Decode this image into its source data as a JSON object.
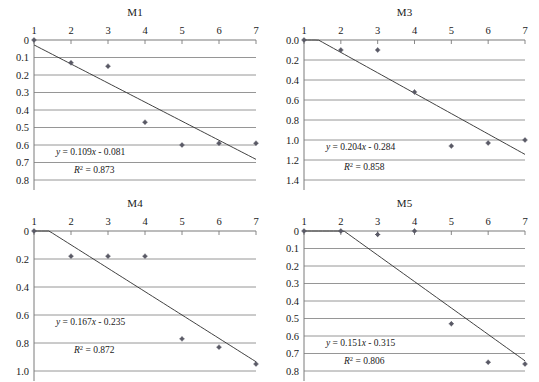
{
  "figure": {
    "background": "#ffffff",
    "marker_color": "#5a5a66",
    "grid_color": "#8a8a8a",
    "line_color": "#2b2b2b",
    "panel_count": 4
  },
  "chart_data": [
    {
      "type": "scatter",
      "title": "M1",
      "xlabel": "",
      "ylabel": "",
      "x": [
        1,
        2,
        3,
        4,
        5,
        6,
        7
      ],
      "values": [
        0.0,
        0.13,
        0.15,
        0.47,
        0.6,
        0.59,
        0.59
      ],
      "xticks": [
        "1",
        "2",
        "3",
        "4",
        "5",
        "6",
        "7"
      ],
      "yticks": [
        "0",
        "0.1",
        "0.2",
        "0.3",
        "0.4",
        "0.5",
        "0.6",
        "0.7",
        "0.8"
      ],
      "ytickvalues": [
        0,
        0.1,
        0.2,
        0.3,
        0.4,
        0.5,
        0.6,
        0.7,
        0.8
      ],
      "xlim": [
        1,
        7
      ],
      "ylim": [
        0,
        0.8
      ],
      "y_axis_inverted": true,
      "x_axis_position": "top",
      "grid": true,
      "legend": "none",
      "annotations": {
        "equation": "y = 0.109x - 0.081",
        "equation_slope": 0.109,
        "equation_intercept": -0.081,
        "r_squared_label": "R",
        "r_squared_exponent": "2",
        "r_squared_text": " = 0.873",
        "r_squared_value": 0.873
      }
    },
    {
      "type": "scatter",
      "title": "M3",
      "xlabel": "",
      "ylabel": "",
      "x": [
        1,
        2,
        3,
        4,
        5,
        6,
        7
      ],
      "values": [
        0.0,
        0.1,
        0.1,
        0.52,
        1.06,
        1.03,
        1.0
      ],
      "xticks": [
        "1",
        "2",
        "3",
        "4",
        "5",
        "6",
        "7"
      ],
      "yticks": [
        "0.0",
        "0.2",
        "0.4",
        "0.6",
        "0.8",
        "1.0",
        "1.2",
        "1.4"
      ],
      "ytickvalues": [
        0.0,
        0.2,
        0.4,
        0.6,
        0.8,
        1.0,
        1.2,
        1.4
      ],
      "xlim": [
        1,
        7
      ],
      "ylim": [
        0,
        1.4
      ],
      "y_axis_inverted": true,
      "x_axis_position": "top",
      "grid": true,
      "legend": "none",
      "annotations": {
        "equation": "y = 0.204x - 0.284",
        "equation_slope": 0.204,
        "equation_intercept": -0.284,
        "r_squared_label": "R",
        "r_squared_exponent": "2",
        "r_squared_text": " = 0.858",
        "r_squared_value": 0.858
      }
    },
    {
      "type": "scatter",
      "title": "M4",
      "xlabel": "",
      "ylabel": "",
      "x": [
        1,
        2,
        3,
        4,
        5,
        6,
        7
      ],
      "values": [
        0.0,
        0.18,
        0.18,
        0.18,
        0.77,
        0.83,
        0.95
      ],
      "xticks": [
        "1",
        "2",
        "3",
        "4",
        "5",
        "6",
        "7"
      ],
      "yticks": [
        "0",
        "0.2",
        "0.4",
        "0.6",
        "0.8",
        "1.0"
      ],
      "ytickvalues": [
        0,
        0.2,
        0.4,
        0.6,
        0.8,
        1.0
      ],
      "xlim": [
        1,
        7
      ],
      "ylim": [
        0,
        1.0
      ],
      "y_axis_inverted": true,
      "x_axis_position": "top",
      "grid": true,
      "legend": "none",
      "annotations": {
        "equation": "y = 0.167x - 0.235",
        "equation_slope": 0.167,
        "equation_intercept": -0.235,
        "r_squared_label": "R",
        "r_squared_exponent": "2",
        "r_squared_text": " = 0.872",
        "r_squared_value": 0.872
      }
    },
    {
      "type": "scatter",
      "title": "M5",
      "xlabel": "",
      "ylabel": "",
      "x": [
        1,
        2,
        3,
        4,
        5,
        6,
        7
      ],
      "values": [
        0.0,
        0.0,
        0.02,
        0.0,
        0.53,
        0.75,
        0.76
      ],
      "xticks": [
        "1",
        "2",
        "3",
        "4",
        "5",
        "6",
        "7"
      ],
      "yticks": [
        "0",
        "0.1",
        "0.2",
        "0.3",
        "0.4",
        "0.5",
        "0.6",
        "0.7",
        "0.8"
      ],
      "ytickvalues": [
        0,
        0.1,
        0.2,
        0.3,
        0.4,
        0.5,
        0.6,
        0.7,
        0.8
      ],
      "xlim": [
        1,
        7
      ],
      "ylim": [
        0,
        0.8
      ],
      "y_axis_inverted": true,
      "x_axis_position": "top",
      "grid": true,
      "legend": "none",
      "annotations": {
        "equation": "y = 0.151x - 0.315",
        "equation_slope": 0.151,
        "equation_intercept": -0.315,
        "r_squared_label": "R",
        "r_squared_exponent": "2",
        "r_squared_text": " = 0.806",
        "r_squared_value": 0.806
      }
    }
  ]
}
